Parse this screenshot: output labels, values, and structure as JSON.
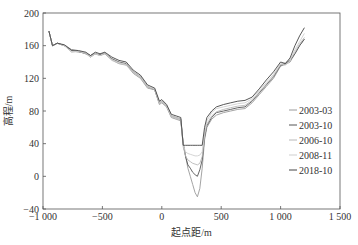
{
  "chart_data": {
    "type": "line",
    "title": "",
    "xlabel": "起点距/m",
    "ylabel": "高程/m",
    "xlim": [
      -1000,
      1500
    ],
    "ylim": [
      -40,
      200
    ],
    "xticks": [
      -1000,
      -500,
      0,
      500,
      1000,
      1500
    ],
    "xtick_labels": [
      "−1 000",
      "−500",
      "0",
      "500",
      "1 000",
      "1 500"
    ],
    "yticks": [
      -40,
      0,
      40,
      80,
      120,
      160,
      200
    ],
    "ytick_labels": [
      "−40",
      "0",
      "40",
      "80",
      "120",
      "160",
      "200"
    ],
    "grid": false,
    "legend_position": "right-inside",
    "series": [
      {
        "name": "2003-03",
        "color": "#9a9a9a",
        "x": [
          -950,
          -920,
          -880,
          -820,
          -760,
          -700,
          -640,
          -600,
          -560,
          -520,
          -480,
          -420,
          -360,
          -300,
          -240,
          -180,
          -120,
          -60,
          -20,
          0,
          40,
          80,
          120,
          160,
          180,
          200,
          220,
          240,
          260,
          280,
          300,
          320,
          340,
          360,
          380,
          420,
          460,
          520,
          580,
          640,
          700,
          760,
          820,
          880,
          940,
          1000,
          1040,
          1080,
          1120,
          1160,
          1200
        ],
        "y": [
          178,
          160,
          163,
          160,
          154,
          152,
          151,
          146,
          150,
          148,
          150,
          143,
          138,
          137,
          126,
          120,
          108,
          106,
          88,
          90,
          85,
          72,
          70,
          68,
          40,
          25,
          10,
          0,
          -10,
          -20,
          -25,
          -15,
          10,
          45,
          60,
          70,
          75,
          78,
          80,
          82,
          83,
          90,
          100,
          110,
          120,
          135,
          137,
          140,
          150,
          160,
          168
        ]
      },
      {
        "name": "2003-10",
        "color": "#555555",
        "x": [
          -950,
          -920,
          -880,
          -820,
          -760,
          -700,
          -640,
          -600,
          -560,
          -520,
          -480,
          -420,
          -360,
          -300,
          -240,
          -180,
          -120,
          -60,
          -20,
          0,
          40,
          80,
          120,
          160,
          180,
          200,
          220,
          240,
          260,
          280,
          300,
          320,
          340,
          360,
          380,
          420,
          460,
          520,
          580,
          640,
          700,
          760,
          820,
          880,
          940,
          1000,
          1040,
          1080,
          1120,
          1160,
          1200
        ],
        "y": [
          178,
          160,
          163,
          160,
          154,
          153,
          150,
          148,
          150,
          149,
          151,
          144,
          140,
          138,
          128,
          122,
          110,
          106,
          90,
          92,
          86,
          74,
          72,
          70,
          40,
          24,
          14,
          10,
          5,
          2,
          0,
          8,
          20,
          48,
          62,
          72,
          78,
          80,
          82,
          84,
          85,
          92,
          102,
          112,
          122,
          136,
          138,
          142,
          150,
          160,
          168
        ]
      },
      {
        "name": "2006-10",
        "color": "#b8b8b8",
        "x": [
          -950,
          -920,
          -880,
          -820,
          -760,
          -700,
          -640,
          -600,
          -560,
          -520,
          -480,
          -420,
          -360,
          -300,
          -240,
          -180,
          -120,
          -60,
          -20,
          0,
          40,
          80,
          120,
          160,
          180,
          200,
          220,
          240,
          260,
          280,
          300,
          320,
          340,
          360,
          380,
          420,
          460,
          520,
          580,
          640,
          700,
          760,
          820,
          880,
          940,
          1000,
          1040,
          1080,
          1120,
          1160,
          1200
        ],
        "y": [
          178,
          160,
          163,
          160,
          152,
          153,
          150,
          146,
          150,
          148,
          150,
          142,
          138,
          136,
          127,
          121,
          109,
          106,
          89,
          91,
          85,
          73,
          71,
          69,
          36,
          25,
          20,
          18,
          16,
          15,
          14,
          16,
          24,
          50,
          64,
          74,
          79,
          82,
          84,
          86,
          87,
          93,
          103,
          113,
          123,
          137,
          139,
          143,
          152,
          162,
          170
        ]
      },
      {
        "name": "2008-11",
        "color": "#cfcfcf",
        "x": [
          -950,
          -920,
          -880,
          -820,
          -760,
          -700,
          -640,
          -600,
          -560,
          -520,
          -480,
          -420,
          -360,
          -300,
          -240,
          -180,
          -120,
          -60,
          -20,
          0,
          40,
          80,
          120,
          160,
          180,
          200,
          220,
          240,
          260,
          280,
          300,
          320,
          340,
          360,
          380,
          420,
          460,
          520,
          580,
          640,
          700,
          760,
          820,
          880,
          940,
          1000,
          1040,
          1080,
          1120,
          1160,
          1200
        ],
        "y": [
          178,
          160,
          163,
          160,
          153,
          153,
          151,
          147,
          150,
          148,
          151,
          143,
          139,
          137,
          128,
          122,
          110,
          107,
          90,
          92,
          86,
          74,
          72,
          70,
          38,
          30,
          28,
          27,
          26,
          25,
          25,
          26,
          30,
          54,
          68,
          78,
          83,
          85,
          87,
          89,
          90,
          95,
          105,
          115,
          125,
          138,
          136,
          142,
          155,
          165,
          175
        ]
      },
      {
        "name": "2018-10",
        "color": "#444444",
        "x": [
          -950,
          -920,
          -880,
          -820,
          -760,
          -700,
          -640,
          -600,
          -560,
          -520,
          -480,
          -420,
          -360,
          -300,
          -240,
          -180,
          -120,
          -60,
          -20,
          0,
          40,
          80,
          120,
          160,
          180,
          200,
          220,
          240,
          260,
          280,
          300,
          320,
          340,
          360,
          380,
          420,
          460,
          520,
          580,
          640,
          700,
          760,
          820,
          880,
          940,
          1000,
          1040,
          1080,
          1120,
          1160,
          1200
        ],
        "y": [
          178,
          160,
          163,
          161,
          155,
          154,
          152,
          148,
          152,
          150,
          152,
          146,
          142,
          140,
          130,
          124,
          112,
          108,
          92,
          94,
          88,
          76,
          74,
          72,
          38,
          38,
          38,
          38,
          38,
          38,
          38,
          38,
          38,
          60,
          72,
          80,
          85,
          88,
          90,
          92,
          93,
          97,
          107,
          118,
          128,
          140,
          138,
          145,
          160,
          172,
          182
        ]
      }
    ]
  }
}
